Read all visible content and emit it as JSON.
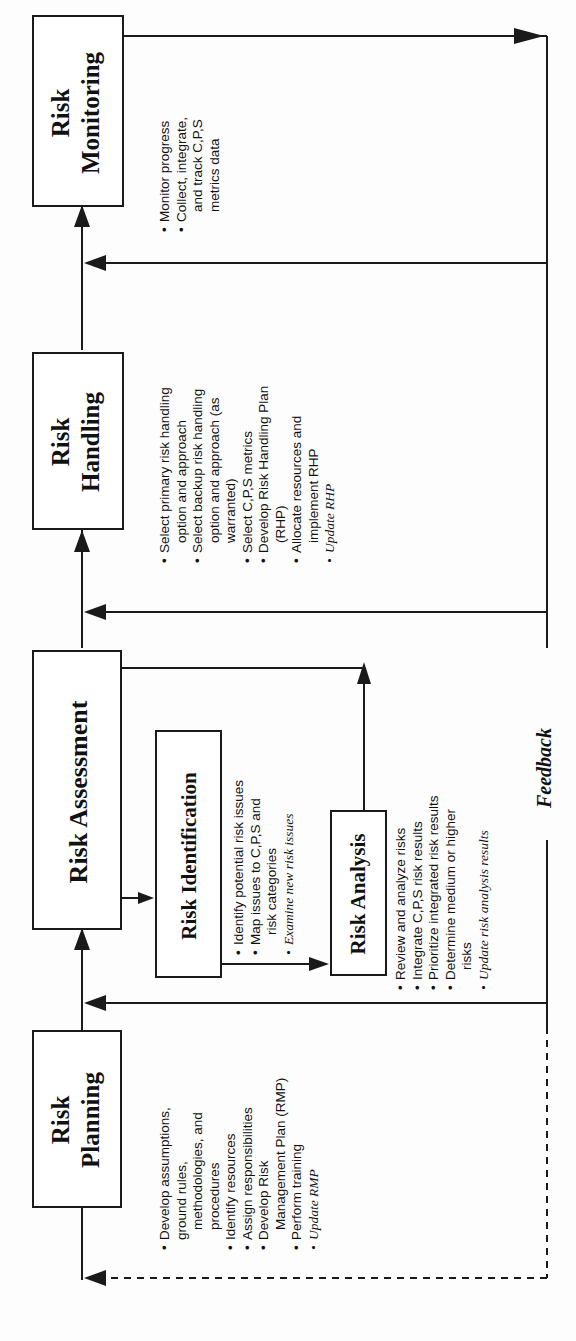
{
  "diagram": {
    "type": "risk-management-process-flow",
    "orientation": "rotated-90-ccw",
    "stages": [
      {
        "id": "planning",
        "title_line1": "Risk",
        "title_line2": "Planning",
        "bullets": [
          "Develop assumptions,",
          "ground rules,",
          "methodologies, and",
          "procedures",
          "Identify resources",
          "Assign responsibilities",
          "Develop Risk",
          "Management Plan (RMP)",
          "Perform training",
          "Update RMP"
        ]
      },
      {
        "id": "assessment",
        "title": "Risk Assessment",
        "substages": [
          {
            "id": "identification",
            "title": "Risk Identification",
            "bullets": [
              "Identify potential risk issues",
              "Map issues to C,P,S and",
              "risk categories",
              "Examine new risk issues"
            ]
          },
          {
            "id": "analysis",
            "title": "Risk Analysis",
            "bullets": [
              "Review and analyze risks",
              "Integrate C,P,S risk results",
              "Prioritize integrated risk results",
              "Determine medium or higher",
              "risks",
              "Update risk analysis results"
            ]
          }
        ]
      },
      {
        "id": "handling",
        "title_line1": "Risk",
        "title_line2": "Handling",
        "bullets": [
          "Select primary risk handling",
          "option and approach",
          "Select backup risk handling",
          "option and approach (as",
          "warranted)",
          "Select C,P,S metrics",
          "Develop Risk Handling Plan",
          "(RHP)",
          "Allocate resources and",
          "implement RHP",
          "Update RHP"
        ]
      },
      {
        "id": "monitoring",
        "title_line1": "Risk",
        "title_line2": "Monitoring",
        "bullets": [
          "Monitor progress",
          "Collect, integrate,",
          "and track C,P,S",
          "metrics data"
        ]
      }
    ],
    "feedback_label": "Feedback",
    "colors": {
      "line": "#1a1a1a",
      "background": "#ffffff"
    }
  }
}
